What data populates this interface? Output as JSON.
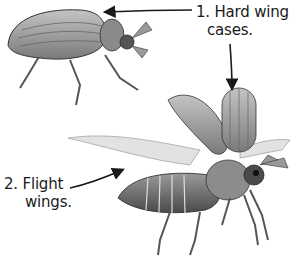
{
  "diagram": {
    "labels": [
      {
        "number": "1.",
        "line1": "1. Hard wing",
        "line2": "cases."
      },
      {
        "number": "2.",
        "line1": "2. Flight",
        "line2": "wings."
      }
    ],
    "colors": {
      "ink": "#1a1a1a",
      "shell": "#8a8a8a",
      "shell_light": "#b5b5b5",
      "wing": "#d8d8d8",
      "background": "#ffffff"
    }
  }
}
